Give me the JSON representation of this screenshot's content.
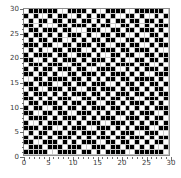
{
  "chart_data": {
    "type": "heatmap",
    "title": "",
    "xlabel": "",
    "ylabel": "",
    "xlim": [
      0,
      30
    ],
    "ylim": [
      0,
      30
    ],
    "xticks": [
      0,
      5,
      10,
      15,
      20,
      25,
      30
    ],
    "yticks": [
      0,
      5,
      10,
      15,
      20,
      25,
      30
    ],
    "grid": true,
    "legend": "none",
    "colors": {
      "on": "#000000",
      "off": "#ffffff",
      "gridline": "#c9c9c9",
      "frame": "#8d8d8d",
      "background": "#ffffff",
      "tick_text": "#3a3a3a"
    },
    "nrows": 30,
    "ncols": 30,
    "value_map": {
      "1": "black",
      "0": "white"
    },
    "matrix": [
      [
        0,
        1,
        1,
        1,
        1,
        1,
        1,
        0,
        0,
        1,
        1,
        1,
        1,
        0,
        1,
        0,
        0,
        1,
        1,
        1,
        1,
        0,
        0,
        1,
        1,
        1,
        1,
        1,
        1,
        0
      ],
      [
        1,
        0,
        1,
        0,
        0,
        1,
        0,
        1,
        1,
        0,
        0,
        1,
        0,
        1,
        0,
        1,
        1,
        0,
        1,
        0,
        0,
        1,
        1,
        0,
        1,
        0,
        0,
        1,
        0,
        1
      ],
      [
        0,
        1,
        0,
        1,
        1,
        0,
        1,
        1,
        0,
        1,
        1,
        0,
        1,
        1,
        0,
        1,
        0,
        1,
        0,
        1,
        1,
        0,
        1,
        1,
        0,
        1,
        1,
        0,
        1,
        0
      ],
      [
        1,
        1,
        0,
        1,
        0,
        0,
        0,
        1,
        1,
        0,
        1,
        1,
        1,
        0,
        1,
        0,
        1,
        1,
        0,
        0,
        1,
        1,
        0,
        1,
        0,
        1,
        0,
        1,
        1,
        1
      ],
      [
        0,
        1,
        1,
        0,
        1,
        1,
        1,
        0,
        1,
        1,
        0,
        0,
        0,
        1,
        1,
        1,
        0,
        0,
        1,
        1,
        0,
        1,
        1,
        0,
        1,
        1,
        1,
        0,
        1,
        0
      ],
      [
        1,
        0,
        1,
        1,
        0,
        1,
        0,
        1,
        0,
        1,
        1,
        1,
        0,
        1,
        0,
        0,
        1,
        1,
        0,
        1,
        1,
        0,
        0,
        1,
        0,
        0,
        1,
        1,
        0,
        1
      ],
      [
        0,
        1,
        0,
        1,
        1,
        0,
        1,
        1,
        0,
        0,
        1,
        0,
        1,
        0,
        1,
        1,
        0,
        1,
        1,
        0,
        0,
        1,
        1,
        0,
        1,
        1,
        0,
        1,
        1,
        0
      ],
      [
        1,
        1,
        1,
        0,
        1,
        1,
        0,
        0,
        1,
        1,
        0,
        1,
        1,
        1,
        0,
        1,
        1,
        0,
        0,
        1,
        1,
        0,
        1,
        1,
        0,
        0,
        1,
        0,
        1,
        1
      ],
      [
        0,
        1,
        0,
        1,
        0,
        0,
        1,
        1,
        0,
        1,
        1,
        1,
        0,
        0,
        1,
        0,
        1,
        1,
        1,
        0,
        1,
        1,
        0,
        1,
        1,
        1,
        0,
        1,
        0,
        0
      ],
      [
        1,
        0,
        1,
        1,
        1,
        1,
        0,
        1,
        1,
        0,
        0,
        1,
        1,
        1,
        0,
        1,
        0,
        0,
        1,
        1,
        0,
        1,
        1,
        0,
        0,
        1,
        1,
        0,
        1,
        1
      ],
      [
        1,
        1,
        0,
        0,
        1,
        0,
        1,
        0,
        1,
        1,
        1,
        0,
        1,
        0,
        1,
        1,
        1,
        0,
        1,
        0,
        1,
        0,
        0,
        1,
        1,
        0,
        1,
        1,
        0,
        1
      ],
      [
        0,
        1,
        1,
        1,
        0,
        1,
        1,
        1,
        0,
        0,
        1,
        1,
        0,
        1,
        1,
        0,
        0,
        1,
        0,
        1,
        1,
        1,
        1,
        0,
        1,
        1,
        0,
        0,
        1,
        0
      ],
      [
        1,
        0,
        1,
        0,
        1,
        1,
        0,
        1,
        1,
        1,
        0,
        1,
        1,
        0,
        0,
        1,
        1,
        1,
        1,
        0,
        0,
        1,
        0,
        1,
        0,
        1,
        1,
        1,
        0,
        1
      ],
      [
        1,
        1,
        0,
        1,
        1,
        0,
        1,
        0,
        0,
        1,
        1,
        0,
        1,
        1,
        1,
        0,
        1,
        0,
        1,
        1,
        1,
        0,
        1,
        0,
        1,
        0,
        0,
        1,
        1,
        1
      ],
      [
        0,
        0,
        1,
        1,
        0,
        1,
        1,
        1,
        1,
        0,
        1,
        1,
        0,
        1,
        0,
        1,
        0,
        1,
        1,
        0,
        1,
        1,
        0,
        1,
        1,
        1,
        1,
        0,
        1,
        0
      ],
      [
        1,
        1,
        0,
        1,
        1,
        1,
        0,
        0,
        1,
        1,
        0,
        1,
        1,
        0,
        1,
        1,
        1,
        0,
        0,
        1,
        0,
        1,
        1,
        0,
        1,
        0,
        1,
        1,
        0,
        1
      ],
      [
        0,
        1,
        1,
        0,
        0,
        1,
        1,
        1,
        0,
        1,
        1,
        0,
        0,
        1,
        1,
        0,
        1,
        1,
        1,
        0,
        1,
        0,
        1,
        1,
        0,
        1,
        0,
        1,
        1,
        0
      ],
      [
        1,
        0,
        1,
        1,
        1,
        0,
        1,
        0,
        1,
        0,
        1,
        1,
        1,
        0,
        1,
        1,
        0,
        1,
        0,
        1,
        1,
        1,
        0,
        1,
        1,
        0,
        1,
        0,
        1,
        1
      ],
      [
        1,
        1,
        0,
        1,
        0,
        1,
        0,
        1,
        1,
        1,
        0,
        0,
        1,
        1,
        0,
        1,
        1,
        0,
        1,
        1,
        0,
        1,
        1,
        0,
        0,
        1,
        1,
        1,
        0,
        1
      ],
      [
        0,
        1,
        1,
        0,
        1,
        1,
        1,
        0,
        1,
        0,
        1,
        1,
        0,
        1,
        1,
        0,
        0,
        1,
        1,
        0,
        1,
        0,
        1,
        1,
        1,
        0,
        1,
        0,
        1,
        0
      ],
      [
        1,
        0,
        1,
        1,
        0,
        0,
        1,
        1,
        0,
        1,
        1,
        0,
        1,
        0,
        1,
        1,
        1,
        0,
        1,
        1,
        0,
        1,
        0,
        1,
        0,
        1,
        0,
        1,
        1,
        1
      ],
      [
        1,
        1,
        0,
        0,
        1,
        1,
        0,
        1,
        1,
        0,
        0,
        1,
        1,
        1,
        0,
        1,
        0,
        1,
        0,
        1,
        1,
        0,
        1,
        0,
        1,
        1,
        1,
        0,
        0,
        1
      ],
      [
        0,
        1,
        1,
        1,
        1,
        0,
        1,
        0,
        1,
        1,
        1,
        0,
        1,
        0,
        1,
        0,
        1,
        1,
        1,
        0,
        0,
        1,
        1,
        1,
        0,
        1,
        0,
        1,
        1,
        0
      ],
      [
        1,
        0,
        0,
        1,
        0,
        1,
        1,
        1,
        0,
        1,
        0,
        1,
        0,
        1,
        1,
        1,
        0,
        0,
        1,
        1,
        1,
        0,
        1,
        0,
        1,
        0,
        1,
        1,
        0,
        1
      ],
      [
        1,
        1,
        1,
        0,
        1,
        1,
        0,
        0,
        1,
        0,
        1,
        1,
        1,
        0,
        0,
        1,
        1,
        1,
        0,
        1,
        0,
        1,
        0,
        1,
        1,
        1,
        0,
        0,
        1,
        1
      ],
      [
        0,
        1,
        0,
        1,
        1,
        0,
        1,
        1,
        0,
        1,
        1,
        0,
        1,
        1,
        1,
        0,
        1,
        0,
        1,
        0,
        1,
        1,
        1,
        0,
        0,
        1,
        1,
        1,
        0,
        0
      ],
      [
        1,
        0,
        1,
        1,
        0,
        1,
        0,
        1,
        1,
        1,
        0,
        1,
        0,
        1,
        0,
        1,
        1,
        1,
        0,
        1,
        1,
        0,
        1,
        1,
        1,
        0,
        1,
        0,
        1,
        1
      ],
      [
        1,
        1,
        0,
        0,
        1,
        1,
        1,
        0,
        1,
        0,
        1,
        0,
        1,
        1,
        1,
        0,
        0,
        1,
        1,
        0,
        1,
        1,
        0,
        1,
        0,
        1,
        0,
        1,
        1,
        0
      ],
      [
        0,
        1,
        1,
        1,
        0,
        1,
        1,
        1,
        0,
        1,
        1,
        1,
        0,
        0,
        1,
        1,
        1,
        0,
        1,
        1,
        0,
        1,
        1,
        0,
        1,
        0,
        1,
        0,
        0,
        1
      ],
      [
        1,
        1,
        1,
        1,
        1,
        0,
        0,
        1,
        1,
        1,
        1,
        0,
        1,
        1,
        0,
        1,
        0,
        1,
        1,
        1,
        1,
        0,
        0,
        1,
        1,
        1,
        1,
        1,
        1,
        0
      ]
    ]
  }
}
